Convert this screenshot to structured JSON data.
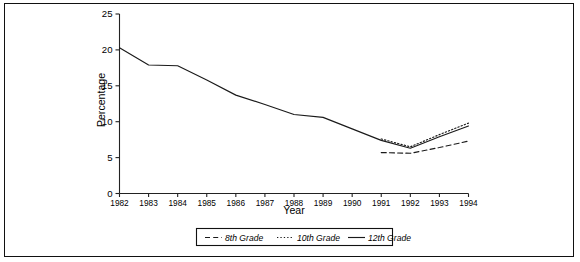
{
  "chart_data": {
    "type": "line",
    "title": "",
    "xlabel": "Year",
    "ylabel": "Percentage",
    "x": [
      1982,
      1983,
      1984,
      1985,
      1986,
      1987,
      1988,
      1989,
      1990,
      1991,
      1992,
      1993,
      1994
    ],
    "xtick_labels": [
      "1982",
      "1983",
      "1984",
      "1985",
      "1986",
      "1987",
      "1988",
      "1989",
      "1990",
      "1991",
      "1992",
      "1993",
      "1994"
    ],
    "ytick_labels": [
      "0",
      "5",
      "10",
      "15",
      "20",
      "25"
    ],
    "yticks": [
      0,
      5,
      10,
      15,
      20,
      25
    ],
    "ylim": [
      0,
      25
    ],
    "xlim": [
      1982,
      1994
    ],
    "grid": false,
    "legend_position": "bottom-center",
    "series": [
      {
        "name": "8th Grade",
        "style": "dashed",
        "color": "#1a1a1a",
        "x": [
          1991,
          1992,
          1993,
          1994
        ],
        "values": [
          5.7,
          5.6,
          6.4,
          7.3
        ]
      },
      {
        "name": "10th Grade",
        "style": "dotted",
        "color": "#1a1a1a",
        "x": [
          1991,
          1992,
          1993,
          1994
        ],
        "values": [
          7.6,
          6.5,
          8.2,
          9.8
        ]
      },
      {
        "name": "12th Grade",
        "style": "solid",
        "color": "#1a1a1a",
        "x": [
          1982,
          1983,
          1984,
          1985,
          1986,
          1987,
          1988,
          1989,
          1990,
          1991,
          1992,
          1993,
          1994
        ],
        "values": [
          20.3,
          17.9,
          17.8,
          15.8,
          13.7,
          12.4,
          11.0,
          10.6,
          9.0,
          7.4,
          6.3,
          7.9,
          9.4
        ]
      }
    ]
  },
  "axes": {
    "y_title": "Percentage",
    "x_title": "Year"
  },
  "legend": {
    "items": [
      {
        "label": "8th Grade"
      },
      {
        "label": "10th Grade"
      },
      {
        "label": "12th Grade"
      }
    ]
  }
}
